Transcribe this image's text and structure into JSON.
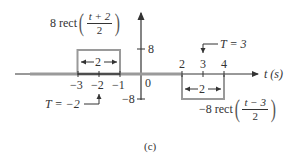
{
  "figure": {
    "caption": "(c)",
    "x_axis_label": "t (s)",
    "y_ticks": [
      {
        "value": "8",
        "label": "8"
      },
      {
        "value": "-8",
        "label": "−8"
      }
    ],
    "origin_label": "0",
    "x_ticks": [
      {
        "value": -3,
        "label": "−3"
      },
      {
        "value": -2,
        "label": "−2"
      },
      {
        "value": -1,
        "label": "−1"
      },
      {
        "value": 2,
        "label": "2"
      },
      {
        "value": 3,
        "label": "3"
      },
      {
        "value": 4,
        "label": "4"
      }
    ],
    "pulses": [
      {
        "name": "positive-pulse",
        "coefficient": "8 rect",
        "numerator": "t + 2",
        "denominator": "2",
        "amplitude": 8,
        "start": -3,
        "end": -1,
        "width_label": "2",
        "center_annotation": "T = −2"
      },
      {
        "name": "negative-pulse",
        "coefficient": "−8 rect",
        "numerator": "t − 3",
        "denominator": "2",
        "amplitude": -8,
        "start": 2,
        "end": 4,
        "width_label": "2",
        "center_annotation": "T = 3"
      }
    ],
    "colors": {
      "axis": "#333333",
      "signal": "#9a9a9a",
      "text": "#333333"
    }
  }
}
